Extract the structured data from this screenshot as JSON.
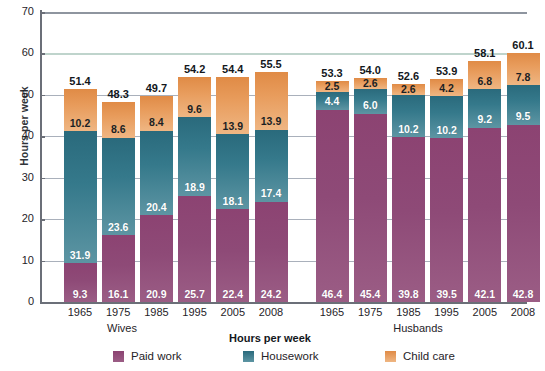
{
  "chart_data": {
    "type": "bar",
    "subtype": "stacked-bar",
    "title": "",
    "xlabel": "",
    "ylabel": "Hours per week",
    "ylim": [
      0,
      70
    ],
    "yticks": [
      0,
      10,
      20,
      30,
      40,
      50,
      60,
      70
    ],
    "grid": true,
    "legend_position": "bottom",
    "legend_title": "Hours per week",
    "categories": [
      "1965",
      "1975",
      "1985",
      "1995",
      "2005",
      "2008"
    ],
    "groups": [
      {
        "name": "Wives",
        "categories": [
          "1965",
          "1975",
          "1985",
          "1995",
          "2005",
          "2008"
        ],
        "series": [
          {
            "name": "Paid work",
            "color": "#8c4372",
            "values": [
              9.3,
              16.1,
              20.9,
              25.7,
              22.4,
              24.2
            ]
          },
          {
            "name": "Housework",
            "color": "#2a6a7c",
            "values": [
              31.9,
              23.6,
              20.4,
              18.9,
              18.1,
              17.4
            ]
          },
          {
            "name": "Child care",
            "color": "#e08b46",
            "values": [
              10.2,
              8.6,
              8.4,
              9.6,
              13.9,
              13.9
            ]
          }
        ],
        "totals": [
          51.4,
          48.3,
          49.7,
          54.2,
          54.4,
          55.5
        ]
      },
      {
        "name": "Husbands",
        "categories": [
          "1965",
          "1975",
          "1985",
          "1995",
          "2005",
          "2008"
        ],
        "series": [
          {
            "name": "Paid work",
            "color": "#8c4372",
            "values": [
              46.4,
              45.4,
              39.8,
              39.5,
              42.1,
              42.8
            ]
          },
          {
            "name": "Housework",
            "color": "#2a6a7c",
            "values": [
              4.4,
              6.0,
              10.2,
              10.2,
              9.2,
              9.5
            ]
          },
          {
            "name": "Child care",
            "color": "#e08b46",
            "values": [
              2.5,
              2.6,
              2.6,
              4.2,
              6.8,
              7.8
            ]
          }
        ],
        "totals": [
          53.3,
          54.0,
          52.6,
          53.9,
          58.1,
          60.1
        ]
      }
    ],
    "legend": [
      {
        "label": "Paid work",
        "color": "#8c4372"
      },
      {
        "label": "Housework",
        "color": "#2a6a7c"
      },
      {
        "label": "Child care",
        "color": "#e08b46"
      }
    ]
  },
  "axis": {
    "y_label": "Hours per week",
    "ticks": [
      "70",
      "60",
      "50",
      "40",
      "30",
      "20",
      "10",
      "0"
    ]
  },
  "groups": {
    "wives": "Wives",
    "husbands": "Husbands"
  },
  "legend": {
    "title": "Hours per week",
    "paid_work": "Paid work",
    "housework": "Housework",
    "child_care": "Child care"
  }
}
